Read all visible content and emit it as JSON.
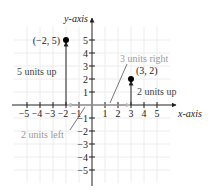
{
  "axes": {
    "x_label": "x-axis",
    "y_label": "y-axis",
    "x_ticks": [
      "−5",
      "−4",
      "−3",
      "−2",
      "−1",
      "1",
      "2",
      "3",
      "4",
      "5"
    ],
    "y_ticks": [
      "5",
      "4",
      "3",
      "2",
      "1",
      "−1",
      "−2",
      "−3",
      "−4",
      "−5"
    ]
  },
  "points": [
    {
      "label": "(−2, 5)",
      "x": -2,
      "y": 5
    },
    {
      "label": "(3, 2)",
      "x": 3,
      "y": 2
    }
  ],
  "annotations": {
    "five_up": "5 units up",
    "two_left": "2 units left",
    "three_right": "3 units right",
    "two_up": "2 units up"
  },
  "colors": {
    "axis": "#222222",
    "grid": "#ececec",
    "annotation": "#9a9a9a",
    "arrow_light": "#bbbbbb"
  }
}
